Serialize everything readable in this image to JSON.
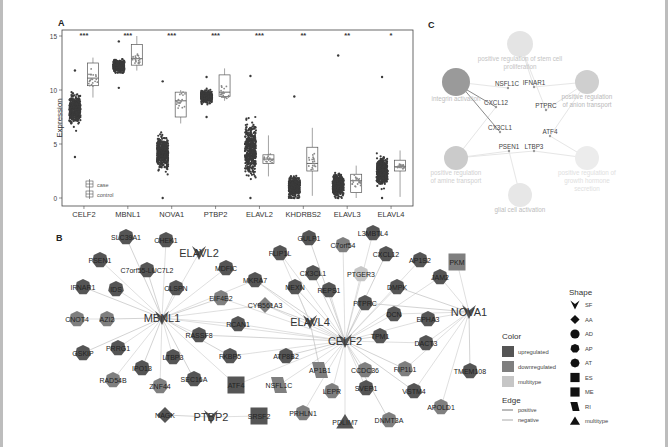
{
  "figure": {
    "panel_labels": {
      "a": "A",
      "b": "B",
      "c": "C"
    }
  },
  "chart_data": [
    {
      "panel": "A",
      "type": "box",
      "title": "",
      "xlabel": "",
      "ylabel": "Expression",
      "ylim": [
        0,
        15
      ],
      "yticks": [
        0,
        5,
        10,
        15
      ],
      "grid": false,
      "legend": {
        "position": "bottom-left",
        "entries": [
          "case",
          "control"
        ]
      },
      "categories": [
        "CELF2",
        "MBNL1",
        "NOVA1",
        "PTBP2",
        "ELAVL2",
        "KHDRBS2",
        "ELAVL3",
        "ELAVL4"
      ],
      "significance": [
        "***",
        "***",
        "***",
        "***",
        "***",
        "**",
        "**",
        "*"
      ],
      "series": [
        {
          "name": "case",
          "min": [
            3.8,
            10.2,
            0.0,
            7.5,
            0.0,
            0.0,
            0.0,
            0.0
          ],
          "q1": [
            7.0,
            11.6,
            2.8,
            8.8,
            2.0,
            0.3,
            0.4,
            1.2
          ],
          "median": [
            8.2,
            12.2,
            4.2,
            9.4,
            4.5,
            1.0,
            1.2,
            2.5
          ],
          "q3": [
            9.6,
            12.8,
            6.0,
            10.0,
            7.0,
            2.4,
            2.6,
            3.9
          ],
          "max": [
            11.8,
            14.5,
            10.8,
            11.2,
            11.3,
            9.4,
            13.2,
            11.2
          ]
        },
        {
          "name": "control",
          "min": [
            9.3,
            11.8,
            6.9,
            9.0,
            2.0,
            0.2,
            0.0,
            0.1
          ],
          "q1": [
            10.4,
            12.3,
            7.5,
            9.4,
            3.2,
            2.5,
            0.5,
            2.5
          ],
          "median": [
            11.1,
            12.9,
            9.0,
            9.8,
            3.6,
            3.2,
            1.6,
            2.9
          ],
          "q3": [
            12.5,
            14.2,
            9.8,
            11.4,
            4.0,
            4.7,
            2.2,
            3.5
          ],
          "max": [
            13.0,
            15.0,
            10.0,
            12.0,
            5.8,
            6.5,
            3.0,
            4.4
          ]
        }
      ]
    },
    {
      "panel": "B",
      "type": "network",
      "hubs": [
        {
          "id": "MBNL1",
          "x": 162,
          "y": 93
        },
        {
          "id": "ELAVL2",
          "x": 199,
          "y": 28
        },
        {
          "id": "ELAVL4",
          "x": 310,
          "y": 97
        },
        {
          "id": "CELF2",
          "x": 345,
          "y": 116
        },
        {
          "id": "NOVA1",
          "x": 469,
          "y": 87
        },
        {
          "id": "PTBP2",
          "x": 211,
          "y": 192
        }
      ],
      "nodes": [
        {
          "id": "SLC39A1",
          "x": 126,
          "y": 12,
          "shape": "AP",
          "color": "up"
        },
        {
          "id": "CHEK1",
          "x": 166,
          "y": 15,
          "shape": "AP",
          "color": "up"
        },
        {
          "id": "PSEN1",
          "x": 100,
          "y": 35,
          "shape": "AP",
          "color": "up"
        },
        {
          "id": "C7orf55-LUC7L2",
          "x": 147,
          "y": 45,
          "shape": "AP",
          "color": "up"
        },
        {
          "id": "MDFIC",
          "x": 226,
          "y": 43,
          "shape": "AP",
          "color": "up"
        },
        {
          "id": "MKRA7",
          "x": 255,
          "y": 55,
          "shape": "AP",
          "color": "up"
        },
        {
          "id": "IFNAR1",
          "x": 83,
          "y": 62,
          "shape": "AP",
          "color": "up"
        },
        {
          "id": "IDS",
          "x": 116,
          "y": 64,
          "shape": "AP",
          "color": "up"
        },
        {
          "id": "CLSPN",
          "x": 176,
          "y": 63,
          "shape": "AP",
          "color": "up"
        },
        {
          "id": "EIF4E2",
          "x": 221,
          "y": 73,
          "shape": "AP",
          "color": "down"
        },
        {
          "id": "CYB561A3",
          "x": 265,
          "y": 80,
          "shape": "AA",
          "color": "down"
        },
        {
          "id": "CNOT4",
          "x": 77,
          "y": 94,
          "shape": "AP",
          "color": "down"
        },
        {
          "id": "AZI2",
          "x": 107,
          "y": 94,
          "shape": "AP",
          "color": "down"
        },
        {
          "id": "RCAN1",
          "x": 238,
          "y": 99,
          "shape": "AP",
          "color": "up"
        },
        {
          "id": "RASSF8",
          "x": 199,
          "y": 110,
          "shape": "AP",
          "color": "up"
        },
        {
          "id": "GSKIP",
          "x": 83,
          "y": 128,
          "shape": "AP",
          "color": "up"
        },
        {
          "id": "PRRG1",
          "x": 118,
          "y": 123,
          "shape": "AP",
          "color": "up"
        },
        {
          "id": "LTBP3",
          "x": 173,
          "y": 132,
          "shape": "AP",
          "color": "up"
        },
        {
          "id": "FKBP5",
          "x": 230,
          "y": 131,
          "shape": "AP",
          "color": "up"
        },
        {
          "id": "ATP8B2",
          "x": 286,
          "y": 131,
          "shape": "AP",
          "color": "up"
        },
        {
          "id": "IPO13",
          "x": 142,
          "y": 143,
          "shape": "AP",
          "color": "up"
        },
        {
          "id": "AP1B1",
          "x": 320,
          "y": 145,
          "shape": "RI",
          "color": "down"
        },
        {
          "id": "RAD54B",
          "x": 113,
          "y": 155,
          "shape": "AP",
          "color": "down"
        },
        {
          "id": "SEC16A",
          "x": 194,
          "y": 154,
          "shape": "AP",
          "color": "up"
        },
        {
          "id": "ZNF44",
          "x": 160,
          "y": 161,
          "shape": "AP",
          "color": "down"
        },
        {
          "id": "ATF4",
          "x": 236,
          "y": 160,
          "shape": "ES",
          "color": "up"
        },
        {
          "id": "NSFL1C",
          "x": 279,
          "y": 160,
          "shape": "RI",
          "color": "down"
        },
        {
          "id": "NAGK",
          "x": 165,
          "y": 190,
          "shape": "AA",
          "color": "up"
        },
        {
          "id": "SRSF2",
          "x": 259,
          "y": 191,
          "shape": "ES",
          "color": "up"
        },
        {
          "id": "GULP1",
          "x": 309,
          "y": 13,
          "shape": "AP",
          "color": "up"
        },
        {
          "id": "C7orf54",
          "x": 343,
          "y": 20,
          "shape": "AP",
          "color": "down"
        },
        {
          "id": "L3MBTL4",
          "x": 373,
          "y": 8,
          "shape": "AP",
          "color": "up"
        },
        {
          "id": "CXCL12",
          "x": 386,
          "y": 29,
          "shape": "AP",
          "color": "up"
        },
        {
          "id": "AP1S2",
          "x": 420,
          "y": 35,
          "shape": "AP",
          "color": "up"
        },
        {
          "id": "PKM",
          "x": 457,
          "y": 37,
          "shape": "ES",
          "color": "down"
        },
        {
          "id": "FLIP1L",
          "x": 280,
          "y": 28,
          "shape": "AP",
          "color": "up"
        },
        {
          "id": "CX3CL1",
          "x": 313,
          "y": 48,
          "shape": "AP",
          "color": "up"
        },
        {
          "id": "PTGER3",
          "x": 361,
          "y": 49,
          "shape": "AP",
          "color": "multi"
        },
        {
          "id": "JAM2",
          "x": 440,
          "y": 52,
          "shape": "AP",
          "color": "up"
        },
        {
          "id": "NEXN",
          "x": 295,
          "y": 62,
          "shape": "AP",
          "color": "up"
        },
        {
          "id": "REPS1",
          "x": 329,
          "y": 65,
          "shape": "AP",
          "color": "up"
        },
        {
          "id": "DMPK",
          "x": 397,
          "y": 62,
          "shape": "AP",
          "color": "up"
        },
        {
          "id": "PTPRC",
          "x": 365,
          "y": 78,
          "shape": "AP",
          "color": "up"
        },
        {
          "id": "DCN",
          "x": 394,
          "y": 89,
          "shape": "AP",
          "color": "up"
        },
        {
          "id": "EPHA3",
          "x": 428,
          "y": 94,
          "shape": "AP",
          "color": "up"
        },
        {
          "id": "TPM1",
          "x": 380,
          "y": 111,
          "shape": "AP",
          "color": "up"
        },
        {
          "id": "DACT3",
          "x": 426,
          "y": 118,
          "shape": "AP",
          "color": "up"
        },
        {
          "id": "CCDC36",
          "x": 365,
          "y": 145,
          "shape": "AP",
          "color": "down"
        },
        {
          "id": "FIP1L1",
          "x": 405,
          "y": 144,
          "shape": "AP",
          "color": "down"
        },
        {
          "id": "TMEM108",
          "x": 470,
          "y": 146,
          "shape": "AP",
          "color": "up"
        },
        {
          "id": "LEPR",
          "x": 332,
          "y": 166,
          "shape": "AP",
          "color": "down"
        },
        {
          "id": "SVEP1",
          "x": 366,
          "y": 163,
          "shape": "AP",
          "color": "up"
        },
        {
          "id": "VSTM4",
          "x": 414,
          "y": 166,
          "shape": "AP",
          "color": "up"
        },
        {
          "id": "APOLD1",
          "x": 441,
          "y": 182,
          "shape": "AP",
          "color": "down"
        },
        {
          "id": "PRHLN1",
          "x": 303,
          "y": 188,
          "shape": "AP",
          "color": "down"
        },
        {
          "id": "PDLIM7",
          "x": 345,
          "y": 197,
          "shape": "multi",
          "color": "up"
        },
        {
          "id": "DNMT3A",
          "x": 389,
          "y": 195,
          "shape": "AP",
          "color": "down"
        }
      ],
      "edges": [
        [
          "MBNL1",
          "SLC39A1"
        ],
        [
          "MBNL1",
          "CHEK1"
        ],
        [
          "MBNL1",
          "PSEN1"
        ],
        [
          "MBNL1",
          "C7orf55-LUC7L2"
        ],
        [
          "MBNL1",
          "ELAVL2"
        ],
        [
          "MBNL1",
          "MDFIC"
        ],
        [
          "MBNL1",
          "IFNAR1"
        ],
        [
          "MBNL1",
          "IDS"
        ],
        [
          "MBNL1",
          "CLSPN"
        ],
        [
          "MBNL1",
          "EIF4E2"
        ],
        [
          "MBNL1",
          "MKRA7"
        ],
        [
          "MBNL1",
          "CYB561A3"
        ],
        [
          "MBNL1",
          "AZI2"
        ],
        [
          "MBNL1",
          "RCAN1"
        ],
        [
          "MBNL1",
          "RASSF8"
        ],
        [
          "MBNL1",
          "GSKIP"
        ],
        [
          "MBNL1",
          "PRRG1"
        ],
        [
          "MBNL1",
          "LTBP3"
        ],
        [
          "MBNL1",
          "IPO13"
        ],
        [
          "MBNL1",
          "RAD54B"
        ],
        [
          "MBNL1",
          "ZNF44"
        ],
        [
          "MBNL1",
          "SEC16A"
        ],
        [
          "MBNL1",
          "ATF4"
        ],
        [
          "MBNL1",
          "CELF2"
        ],
        [
          "MBNL1",
          "FKBP5"
        ],
        [
          "AZI2",
          "CNOT4"
        ],
        [
          "CELF2",
          "ELAVL4"
        ],
        [
          "CELF2",
          "GULP1"
        ],
        [
          "CELF2",
          "C7orf54"
        ],
        [
          "CELF2",
          "L3MBTL4"
        ],
        [
          "CELF2",
          "CXCL12"
        ],
        [
          "CELF2",
          "AP1S2"
        ],
        [
          "CELF2",
          "FLIP1L"
        ],
        [
          "CELF2",
          "CX3CL1"
        ],
        [
          "CELF2",
          "PTGER3"
        ],
        [
          "CELF2",
          "JAM2"
        ],
        [
          "CELF2",
          "NEXN"
        ],
        [
          "CELF2",
          "REPS1"
        ],
        [
          "CELF2",
          "DMPK"
        ],
        [
          "CELF2",
          "PTPRC"
        ],
        [
          "CELF2",
          "DCN"
        ],
        [
          "CELF2",
          "EPHA3"
        ],
        [
          "CELF2",
          "TPM1"
        ],
        [
          "CELF2",
          "DACT3"
        ],
        [
          "CELF2",
          "CCDC36"
        ],
        [
          "CELF2",
          "FIP1L1"
        ],
        [
          "CELF2",
          "LEPR"
        ],
        [
          "CELF2",
          "SVEP1"
        ],
        [
          "CELF2",
          "VSTM4"
        ],
        [
          "CELF2",
          "PRHLN1"
        ],
        [
          "CELF2",
          "PDLIM7"
        ],
        [
          "CELF2",
          "DNMT3A"
        ],
        [
          "CELF2",
          "AP1B1"
        ],
        [
          "CELF2",
          "NSFL1C"
        ],
        [
          "CELF2",
          "ATP8B2"
        ],
        [
          "CELF2",
          "ATF4"
        ],
        [
          "CELF2",
          "RCAN1"
        ],
        [
          "CELF2",
          "RASSF8"
        ],
        [
          "CELF2",
          "FKBP5"
        ],
        [
          "CELF2",
          "CYB561A3"
        ],
        [
          "CELF2",
          "MKRA7"
        ],
        [
          "CELF2",
          "EIF4E2"
        ],
        [
          "ELAVL4",
          "MKRA7"
        ],
        [
          "ELAVL4",
          "AP1B1"
        ],
        [
          "ELAVL4",
          "NEXN"
        ],
        [
          "ELAVL4",
          "FLIP1L"
        ],
        [
          "ELAVL4",
          "CYB561A3"
        ],
        [
          "NOVA1",
          "PKM"
        ],
        [
          "NOVA1",
          "JAM2"
        ],
        [
          "NOVA1",
          "DMPK"
        ],
        [
          "NOVA1",
          "EPHA3"
        ],
        [
          "NOVA1",
          "DACT3"
        ],
        [
          "NOVA1",
          "TMEM108"
        ],
        [
          "NOVA1",
          "APOLD1"
        ],
        [
          "NOVA1",
          "VSTM4"
        ],
        [
          "NOVA1",
          "PTPRC"
        ],
        [
          "NOVA1",
          "FIP1L1"
        ],
        [
          "NOVA1",
          "DCN"
        ],
        [
          "PTBP2",
          "NAGK"
        ],
        [
          "PTBP2",
          "SRSF2"
        ]
      ],
      "legend": {
        "color_title": "Color",
        "colors": [
          {
            "label": "upregulated",
            "hex": "#555555"
          },
          {
            "label": "downregulated",
            "hex": "#7f7f7f"
          },
          {
            "label": "multitype",
            "hex": "#c6c6c6"
          }
        ],
        "edge_title": "Edge",
        "edges": [
          {
            "label": "positive",
            "hex": "#777777"
          },
          {
            "label": "negative",
            "hex": "#aaaaaa"
          }
        ],
        "shape_title": "Shape",
        "shapes": [
          {
            "label": "SF",
            "glyph": "v"
          },
          {
            "label": "AA",
            "glyph": "diamond"
          },
          {
            "label": "AD",
            "glyph": "circle"
          },
          {
            "label": "AP",
            "glyph": "hexagon"
          },
          {
            "label": "AT",
            "glyph": "octagon"
          },
          {
            "label": "ES",
            "glyph": "square"
          },
          {
            "label": "ME",
            "glyph": "rounded-square"
          },
          {
            "label": "RI",
            "glyph": "parallelogram"
          },
          {
            "label": "multitype",
            "glyph": "triangle"
          }
        ]
      }
    },
    {
      "panel": "C",
      "type": "network",
      "terms": [
        {
          "label_lines": [
            "positive regulation of stem cell",
            "proliferation"
          ],
          "x": 100,
          "y": 44,
          "r": 13,
          "shade": "#e4e4e4",
          "text": "#c4c4c4"
        },
        {
          "label_lines": [
            "integrin activation"
          ],
          "x": 36,
          "y": 82,
          "r": 14,
          "shade": "#9a9a9a",
          "text": "#bdbdbd"
        },
        {
          "label_lines": [
            "positive regulation",
            "of anion transport"
          ],
          "x": 167,
          "y": 82,
          "r": 12,
          "shade": "#cfcfcf",
          "text": "#b9b9b9"
        },
        {
          "label_lines": [
            "positive regulation",
            "of amine transport"
          ],
          "x": 36,
          "y": 158,
          "r": 12,
          "shade": "#cbcbcb",
          "text": "#d0d0d0"
        },
        {
          "label_lines": [
            "positive regulation",
            "of amine transport"
          ],
          "x": 36,
          "y": 158,
          "r": 0,
          "shade": "none",
          "text": "none"
        },
        {
          "label_lines": [
            "positive regulation of",
            "growth hormone",
            "secretion"
          ],
          "x": 167,
          "y": 158,
          "r": 12,
          "shade": "#ececec",
          "text": "#e0e0e0"
        },
        {
          "label_lines": [
            "glial cell activation"
          ],
          "x": 100,
          "y": 195,
          "r": 12,
          "shade": "#e7e7e7",
          "text": "#bcbcbc"
        }
      ],
      "genes": [
        {
          "id": "NSFL1C",
          "x": 88,
          "y": 88
        },
        {
          "id": "IFNAR1",
          "x": 114,
          "y": 87
        },
        {
          "id": "CXCL12",
          "x": 76,
          "y": 107
        },
        {
          "id": "PTPRC",
          "x": 126,
          "y": 110
        },
        {
          "id": "CX3CL1",
          "x": 80,
          "y": 132
        },
        {
          "id": "ATF4",
          "x": 130,
          "y": 136
        },
        {
          "id": "PSEN1",
          "x": 89,
          "y": 151
        },
        {
          "id": "LTBP3",
          "x": 114,
          "y": 151
        }
      ]
    }
  ]
}
